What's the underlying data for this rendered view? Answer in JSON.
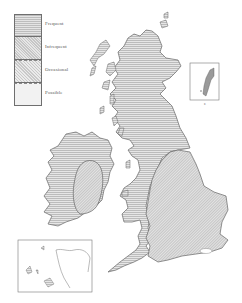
{
  "map": {
    "subject": "British Isles",
    "legend": {
      "items": [
        {
          "label": "Frequent",
          "pattern": "horizontal-hatch"
        },
        {
          "label": "Infrequent",
          "pattern": "dense-diagonal-hatch"
        },
        {
          "label": "Occasional",
          "pattern": "diagonal-hatch"
        },
        {
          "label": "Possible",
          "pattern": "stipple"
        }
      ]
    },
    "regions": [
      {
        "name": "Scotland",
        "category": "Frequent"
      },
      {
        "name": "Northern England",
        "category": "Frequent"
      },
      {
        "name": "Wales",
        "category": "Frequent"
      },
      {
        "name": "South-west England",
        "category": "Frequent"
      },
      {
        "name": "Western Ireland",
        "category": "Frequent"
      },
      {
        "name": "Central/Eastern Ireland",
        "category": "Infrequent"
      },
      {
        "name": "Central and Eastern England",
        "category": "Infrequent"
      }
    ],
    "insets": [
      {
        "name": "Shetland",
        "label": "ᴇ"
      },
      {
        "name": "Channel Islands"
      }
    ],
    "colors": {
      "outline": "#555555",
      "frequent": "#c4c4c4",
      "infrequent": "#cfcfcf",
      "background": "#ffffff"
    }
  }
}
